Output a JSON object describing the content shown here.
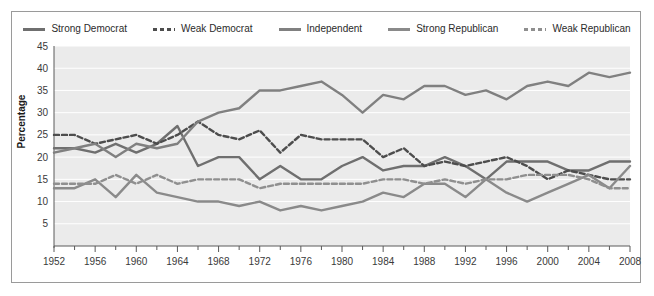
{
  "legend": {
    "position": "top-center",
    "items": [
      {
        "label": "Strong Democrat",
        "style": "solid",
        "color": "#6f6f6f"
      },
      {
        "label": "Weak Democrat",
        "style": "dashed",
        "color": "#4d4d4d"
      },
      {
        "label": "Independent",
        "style": "solid",
        "color": "#808080"
      },
      {
        "label": "Strong Republican",
        "style": "solid",
        "color": "#8a8a8a"
      },
      {
        "label": "Weak Republican",
        "style": "dashed",
        "color": "#8f8f8f"
      }
    ]
  },
  "chart_data": {
    "type": "line",
    "title": "",
    "xlabel": "",
    "ylabel": "Percentage",
    "xlim": [
      1952,
      2008
    ],
    "ylim": [
      0,
      45
    ],
    "yticks": [
      5,
      10,
      15,
      20,
      25,
      30,
      35,
      40,
      45
    ],
    "xticks": [
      1952,
      1956,
      1960,
      1964,
      1968,
      1972,
      1976,
      1980,
      1984,
      1988,
      1992,
      1996,
      2000,
      2004,
      2008
    ],
    "minor_x_step": 2,
    "grid": "horizontal",
    "plot_background": "#ebebeb",
    "x": [
      1952,
      1954,
      1956,
      1958,
      1960,
      1962,
      1964,
      1966,
      1968,
      1970,
      1972,
      1974,
      1976,
      1978,
      1980,
      1982,
      1984,
      1986,
      1988,
      1990,
      1992,
      1994,
      1996,
      1998,
      2000,
      2002,
      2004,
      2006,
      2008
    ],
    "series": [
      {
        "name": "Strong Democrat",
        "style": "solid",
        "color": "#6f6f6f",
        "values": [
          22,
          22,
          21,
          23,
          21,
          23,
          27,
          18,
          20,
          20,
          15,
          18,
          15,
          15,
          18,
          20,
          17,
          18,
          18,
          20,
          18,
          15,
          19,
          19,
          19,
          17,
          17,
          19,
          19
        ]
      },
      {
        "name": "Weak Democrat",
        "style": "dashed",
        "color": "#4d4d4d",
        "values": [
          25,
          25,
          23,
          24,
          25,
          23,
          25,
          28,
          25,
          24,
          26,
          21,
          25,
          24,
          24,
          24,
          20,
          22,
          18,
          19,
          18,
          19,
          20,
          18,
          15,
          17,
          16,
          15,
          15
        ]
      },
      {
        "name": "Independent",
        "style": "solid",
        "color": "#808080",
        "values": [
          21,
          22,
          23,
          20,
          23,
          22,
          23,
          28,
          30,
          31,
          35,
          35,
          36,
          37,
          34,
          30,
          34,
          33,
          36,
          36,
          34,
          35,
          33,
          36,
          37,
          36,
          39,
          38,
          39
        ]
      },
      {
        "name": "Strong Republican",
        "style": "solid",
        "color": "#8a8a8a",
        "values": [
          13,
          13,
          15,
          11,
          16,
          12,
          11,
          10,
          10,
          9,
          10,
          8,
          9,
          8,
          9,
          10,
          12,
          11,
          14,
          14,
          11,
          15,
          12,
          10,
          12,
          14,
          16,
          13,
          18
        ]
      },
      {
        "name": "Weak Republican",
        "style": "dashed",
        "color": "#8f8f8f",
        "values": [
          14,
          14,
          14,
          16,
          14,
          16,
          14,
          15,
          15,
          15,
          13,
          14,
          14,
          14,
          14,
          14,
          15,
          15,
          14,
          15,
          14,
          15,
          15,
          16,
          16,
          16,
          15,
          13,
          13
        ]
      }
    ]
  }
}
